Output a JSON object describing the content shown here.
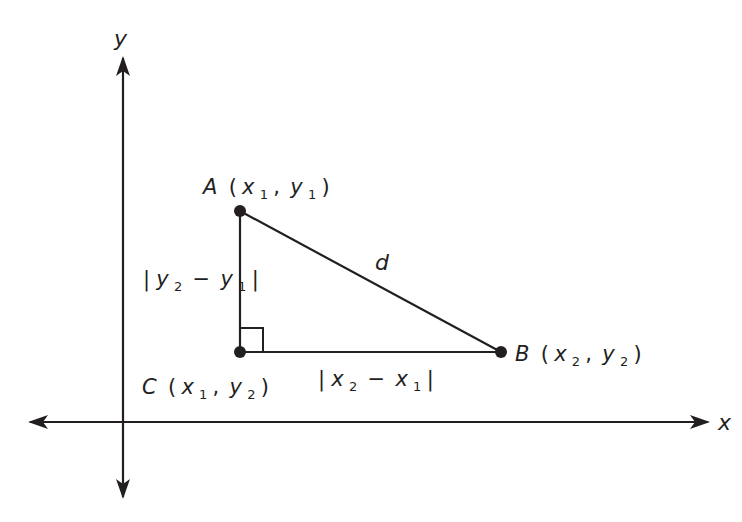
{
  "diagram": {
    "colors": {
      "stroke": "#231f20",
      "background": "#ffffff"
    },
    "axes": {
      "x_label": "x",
      "y_label": "y"
    },
    "points": {
      "A": {
        "name": "A",
        "open": "(",
        "v1": "x",
        "s1": "1",
        "comma": ",",
        "v2": "y",
        "s2": "1",
        "close": ")"
      },
      "B": {
        "name": "B",
        "open": "(",
        "v1": "x",
        "s1": "2",
        "comma": ",",
        "v2": "y",
        "s2": "2",
        "close": ")"
      },
      "C": {
        "name": "C",
        "open": "(",
        "v1": "x",
        "s1": "1",
        "comma": ",",
        "v2": "y",
        "s2": "2",
        "close": ")"
      }
    },
    "segments": {
      "hypotenuse": {
        "label": "d"
      },
      "vertical": {
        "bar_l": "|",
        "v1": "y",
        "s1": "2",
        "minus": "−",
        "v2": "y",
        "s2": "1",
        "bar_r": "|"
      },
      "horizontal": {
        "bar_l": "|",
        "v1": "x",
        "s1": "2",
        "minus": "−",
        "v2": "x",
        "s2": "1",
        "bar_r": "|"
      }
    }
  }
}
